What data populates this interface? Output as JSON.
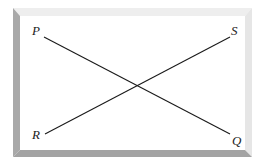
{
  "diagram": {
    "points": [
      {
        "id": "P",
        "label": "P"
      },
      {
        "id": "Q",
        "label": "Q"
      },
      {
        "id": "R",
        "label": "R"
      },
      {
        "id": "S",
        "label": "S"
      }
    ],
    "segments": [
      {
        "from": "P",
        "to": "Q"
      },
      {
        "from": "R",
        "to": "S"
      }
    ],
    "colors": {
      "line": "#1a1a1a",
      "frame_dark": "#a8a8a8",
      "frame_light": "#ececec",
      "background": "#ffffff"
    }
  }
}
